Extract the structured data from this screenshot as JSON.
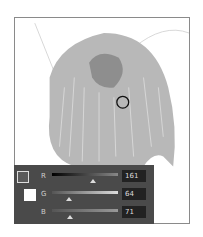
{
  "canvas": {
    "cursor": "brush-circle-cursor"
  },
  "color_panel": {
    "swatch": {
      "foreground": "#5a5a5a",
      "background": "#ffffff"
    },
    "channels": [
      {
        "label": "R",
        "value": "161",
        "thumb_pct": 63
      },
      {
        "label": "G",
        "value": "64",
        "thumb_pct": 25
      },
      {
        "label": "B",
        "value": "71",
        "thumb_pct": 28
      }
    ]
  }
}
